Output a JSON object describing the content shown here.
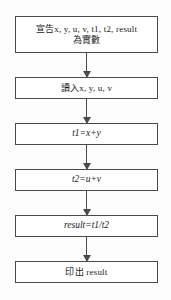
{
  "diagram": {
    "type": "flowchart",
    "orientation": "top-to-bottom",
    "language": "zh-Hant",
    "background_color": "#fdfdfd",
    "stroke_color": "#4a4a4a",
    "text_color": "#1b1b1b",
    "nodes": [
      {
        "id": "declare",
        "shape": "rectangle",
        "role": "process",
        "line1": "宣告x, y, u, v, t1, t2, result",
        "line2": "為實數"
      },
      {
        "id": "read",
        "shape": "rectangle",
        "role": "input",
        "line1": "讀入x, y, u, v"
      },
      {
        "id": "t1",
        "shape": "rectangle",
        "role": "process",
        "line1": "t1=x+y"
      },
      {
        "id": "t2",
        "shape": "rectangle",
        "role": "process",
        "line1": "t2=u+v"
      },
      {
        "id": "result",
        "shape": "rectangle",
        "role": "process",
        "line1": "result=t1/t2"
      },
      {
        "id": "print",
        "shape": "rectangle",
        "role": "output",
        "line1": "印出 result"
      }
    ],
    "connectors": [
      {
        "id": "c1",
        "from": "declare",
        "to": "read",
        "arrow": "down"
      },
      {
        "id": "c2",
        "from": "read",
        "to": "t1",
        "arrow": "down"
      },
      {
        "id": "c3",
        "from": "t1",
        "to": "t2",
        "arrow": "down"
      },
      {
        "id": "c4",
        "from": "t2",
        "to": "result",
        "arrow": "down"
      },
      {
        "id": "c5",
        "from": "result",
        "to": "print",
        "arrow": "down"
      }
    ]
  }
}
